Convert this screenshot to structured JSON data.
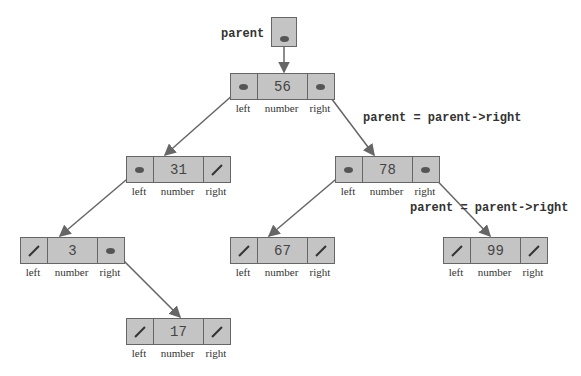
{
  "diagram": {
    "parent_label": "parent",
    "field_labels": {
      "left": "left",
      "number": "number",
      "right": "right"
    },
    "annotations": [
      {
        "text": "parent = parent->right",
        "x": 363,
        "y": 112
      },
      {
        "text": "parent = parent->right",
        "x": 410,
        "y": 202
      }
    ],
    "nodes": [
      {
        "id": "n56",
        "value": "56",
        "x": 230,
        "y": 73,
        "left": "pointer",
        "right": "pointer"
      },
      {
        "id": "n31",
        "value": "31",
        "x": 126,
        "y": 156,
        "left": "pointer",
        "right": "null"
      },
      {
        "id": "n78",
        "value": "78",
        "x": 335,
        "y": 156,
        "left": "pointer",
        "right": "pointer"
      },
      {
        "id": "n3",
        "value": "3",
        "x": 20,
        "y": 237,
        "left": "null",
        "right": "pointer"
      },
      {
        "id": "n67",
        "value": "67",
        "x": 230,
        "y": 237,
        "left": "null",
        "right": "null"
      },
      {
        "id": "n99",
        "value": "99",
        "x": 443,
        "y": 237,
        "left": "null",
        "right": "null"
      },
      {
        "id": "n17",
        "value": "17",
        "x": 126,
        "y": 318,
        "left": "null",
        "right": "null"
      }
    ],
    "edges": [
      {
        "from": "parent",
        "to": "n56"
      },
      {
        "from": "n56.left",
        "to": "n31"
      },
      {
        "from": "n56.right",
        "to": "n78"
      },
      {
        "from": "n31.left",
        "to": "n3"
      },
      {
        "from": "n78.left",
        "to": "n67"
      },
      {
        "from": "n78.right",
        "to": "n99"
      },
      {
        "from": "n3.right",
        "to": "n17"
      }
    ],
    "colors": {
      "node_fill": "#c4c4c4",
      "stroke": "#666666",
      "text": "#333333"
    }
  }
}
